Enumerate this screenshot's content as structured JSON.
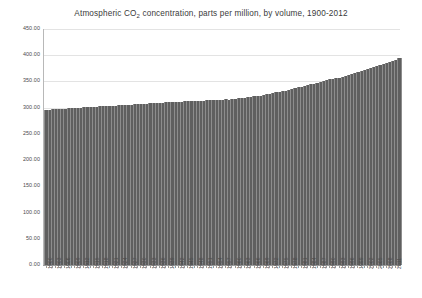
{
  "chart_data": {
    "type": "bar",
    "title": "Atmospheric CO2 concentration, parts per million, by volume, 1900-2012",
    "title_main": "Atmospheric CO",
    "title_sub": "2",
    "title_rest": " concentration, parts per million, by volume, 1900-2012",
    "xlabel": "",
    "ylabel": "",
    "ylim": [
      0,
      450
    ],
    "ytick_step": 50,
    "grid": true,
    "legend": false,
    "bar_color": "#5f5f5f",
    "series_name": "CO2 concentration (ppm)",
    "ytick_labels": [
      "450.00",
      "400.00",
      "350.00",
      "300.00",
      "250.00",
      "200.00",
      "150.00",
      "100.00",
      "50.00",
      "0.00"
    ],
    "ytick_values": [
      450,
      400,
      350,
      300,
      250,
      200,
      150,
      100,
      50,
      0
    ],
    "xtick_label_step": 3,
    "categories": [
      "1900",
      "1901",
      "1902",
      "1903",
      "1904",
      "1905",
      "1906",
      "1907",
      "1908",
      "1909",
      "1910",
      "1911",
      "1912",
      "1913",
      "1914",
      "1915",
      "1916",
      "1917",
      "1918",
      "1919",
      "1920",
      "1921",
      "1922",
      "1923",
      "1924",
      "1925",
      "1926",
      "1927",
      "1928",
      "1929",
      "1930",
      "1931",
      "1932",
      "1933",
      "1934",
      "1935",
      "1936",
      "1937",
      "1938",
      "1939",
      "1940",
      "1941",
      "1942",
      "1943",
      "1944",
      "1945",
      "1946",
      "1947",
      "1948",
      "1949",
      "1950",
      "1951",
      "1952",
      "1953",
      "1954",
      "1955",
      "1956",
      "1957",
      "1958",
      "1959",
      "1960",
      "1961",
      "1962",
      "1963",
      "1964",
      "1965",
      "1966",
      "1967",
      "1968",
      "1969",
      "1970",
      "1971",
      "1972",
      "1973",
      "1974",
      "1975",
      "1976",
      "1977",
      "1978",
      "1979",
      "1980",
      "1981",
      "1982",
      "1983",
      "1984",
      "1985",
      "1986",
      "1987",
      "1988",
      "1989",
      "1990",
      "1991",
      "1992",
      "1993",
      "1994",
      "1995",
      "1996",
      "1997",
      "1998",
      "1999",
      "2000",
      "2001",
      "2002",
      "2003",
      "2004",
      "2005",
      "2006",
      "2007",
      "2008",
      "2009",
      "2010",
      "2011",
      "2012"
    ],
    "values": [
      295.8,
      296.2,
      296.6,
      297.0,
      297.4,
      297.9,
      298.3,
      298.7,
      299.0,
      299.4,
      299.8,
      300.2,
      300.5,
      300.9,
      301.3,
      301.6,
      302.0,
      302.3,
      302.6,
      303.0,
      303.4,
      303.8,
      304.1,
      304.5,
      304.9,
      305.3,
      305.6,
      306.0,
      306.4,
      306.8,
      307.2,
      307.5,
      307.9,
      308.2,
      308.6,
      308.9,
      309.2,
      309.6,
      310.0,
      310.3,
      310.6,
      310.9,
      311.2,
      311.5,
      311.8,
      312.1,
      312.4,
      312.7,
      313.0,
      313.3,
      313.6,
      313.9,
      314.2,
      314.5,
      314.8,
      315.1,
      315.5,
      315.8,
      315.3,
      316.0,
      316.9,
      317.6,
      318.4,
      318.9,
      319.6,
      320.0,
      321.4,
      322.2,
      323.0,
      324.6,
      325.7,
      326.3,
      327.5,
      329.7,
      330.2,
      331.1,
      332.0,
      333.8,
      335.4,
      336.8,
      338.7,
      340.1,
      341.4,
      343.0,
      344.6,
      346.0,
      347.4,
      349.2,
      351.6,
      353.1,
      354.4,
      355.6,
      356.4,
      357.1,
      358.8,
      360.8,
      362.6,
      363.8,
      366.6,
      368.3,
      369.5,
      371.0,
      373.1,
      375.6,
      377.4,
      379.6,
      381.8,
      383.7,
      385.6,
      387.4,
      389.8,
      391.6,
      393.8
    ]
  }
}
